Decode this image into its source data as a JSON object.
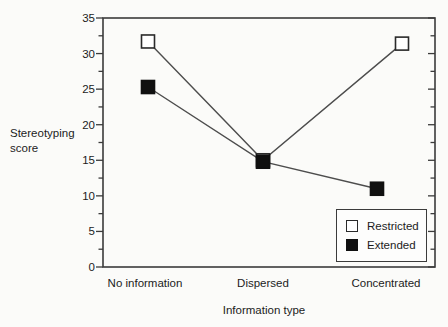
{
  "chart_data": {
    "type": "line",
    "categories": [
      "No information",
      "Dispersed",
      "Concentrated"
    ],
    "series": [
      {
        "name": "Restricted",
        "marker": "open-square",
        "values": [
          31.7,
          15.0,
          31.4
        ]
      },
      {
        "name": "Extended",
        "marker": "filled-square",
        "values": [
          25.3,
          14.8,
          11.0
        ]
      }
    ],
    "title": "",
    "xlabel": "Information type",
    "ylabel": "Stereotyping score",
    "ylim": [
      0,
      35
    ],
    "yticks": [
      35,
      30,
      25,
      20,
      15,
      10,
      5,
      0
    ],
    "minor_tick_interval": 2.5,
    "major_tick_interval": 5,
    "grid": false,
    "legend_position": "lower right",
    "legend": [
      "Restricted",
      "Extended"
    ],
    "colors": {
      "line": "#4d4d4d",
      "axis": "#3b3b3b",
      "marker_open_fill": "#ffffff",
      "marker_filled": "#101010",
      "text": "#1c1c1c",
      "background": "#fbfbf9"
    }
  }
}
